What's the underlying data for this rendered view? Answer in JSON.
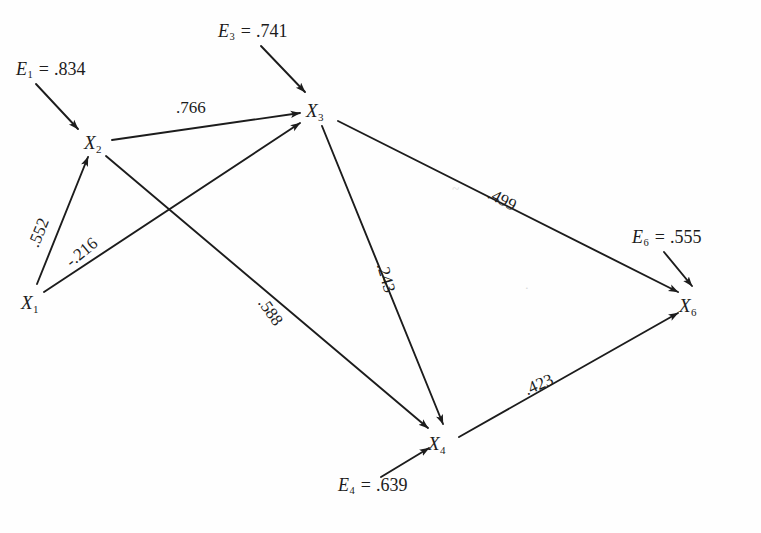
{
  "figure": {
    "type": "path-diagram",
    "background_color": "#fefefe",
    "stroke_color": "#1c1c1c",
    "text_color": "#1c1c1c"
  },
  "nodes": [
    {
      "id": "X1",
      "var": "X",
      "sub": "1",
      "x": 30,
      "y": 302
    },
    {
      "id": "X2",
      "var": "X",
      "sub": "2",
      "x": 93,
      "y": 142
    },
    {
      "id": "X3",
      "var": "X",
      "sub": "3",
      "x": 315,
      "y": 110
    },
    {
      "id": "X4",
      "var": "X",
      "sub": "4",
      "x": 437,
      "y": 443
    },
    {
      "id": "X6",
      "var": "X",
      "sub": "6",
      "x": 688,
      "y": 305
    }
  ],
  "errors": [
    {
      "id": "E1",
      "var": "E",
      "sub": "1",
      "eq": "=",
      "value": ".834",
      "target": "X2",
      "x": 16,
      "y": 62
    },
    {
      "id": "E3",
      "var": "E",
      "sub": "3",
      "eq": "=",
      "value": ".741",
      "target": "X3",
      "x": 218,
      "y": 24
    },
    {
      "id": "E6",
      "var": "E",
      "sub": "6",
      "eq": "=",
      "value": ".555",
      "target": "X6",
      "x": 632,
      "y": 230
    },
    {
      "id": "E4",
      "var": "E",
      "sub": "4",
      "eq": "=",
      "value": ".639",
      "target": "X4",
      "x": 338,
      "y": 478
    }
  ],
  "paths": [
    {
      "id": "p12",
      "from": "X1",
      "to": "X2",
      "coefficient": ".552",
      "label_x": 33,
      "label_y": 238,
      "label_rot": -68
    },
    {
      "id": "p13",
      "from": "X1",
      "to": "X3",
      "coefficient": "-.216",
      "label_x": 68,
      "label_y": 255,
      "label_rot": -40
    },
    {
      "id": "p23",
      "from": "X2",
      "to": "X3",
      "coefficient": ".766",
      "label_x": 176,
      "label_y": 101,
      "label_rot": 0
    },
    {
      "id": "p24",
      "from": "X2",
      "to": "X4",
      "coefficient": ".588",
      "label_x": 262,
      "label_y": 291,
      "label_rot": 55
    },
    {
      "id": "p34",
      "from": "X3",
      "to": "X4",
      "coefficient": ".243",
      "label_x": 382,
      "label_y": 255,
      "label_rot": 74
    },
    {
      "id": "p36",
      "from": "X3",
      "to": "X6",
      "coefficient": ".499",
      "label_x": 489,
      "label_y": 184,
      "label_rot": 28
    },
    {
      "id": "p46",
      "from": "X4",
      "to": "X6",
      "coefficient": ".423",
      "label_x": 525,
      "label_y": 382,
      "label_rot": -24
    }
  ],
  "artifacts": [
    {
      "id": "smudge1",
      "text": "~",
      "x": 452,
      "y": 186
    },
    {
      "id": "smudge2",
      "text": "·",
      "x": 525,
      "y": 285
    }
  ]
}
